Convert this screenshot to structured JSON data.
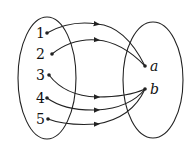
{
  "domain": [
    {
      "label": "1",
      "x": 47,
      "y": 33
    },
    {
      "label": "2",
      "x": 52,
      "y": 54
    },
    {
      "label": "3",
      "x": 49,
      "y": 75
    },
    {
      "label": "4",
      "x": 47,
      "y": 98
    },
    {
      "label": "5",
      "x": 48,
      "y": 119
    }
  ],
  "codomain": [
    {
      "label": "a",
      "x": 145,
      "y": 66
    },
    {
      "label": "b",
      "x": 145,
      "y": 89
    }
  ],
  "mapping": [
    {
      "from": "1",
      "to": "a"
    },
    {
      "from": "2",
      "to": "a"
    },
    {
      "from": "3",
      "to": "b"
    },
    {
      "from": "4",
      "to": "b"
    },
    {
      "from": "5",
      "to": "b"
    }
  ],
  "colors": {
    "stroke": "#222222"
  }
}
